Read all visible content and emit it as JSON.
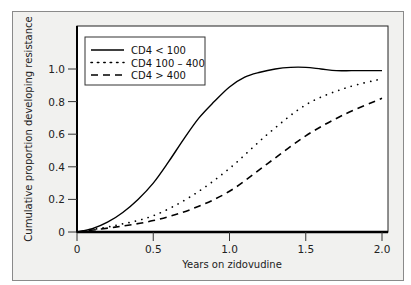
{
  "chart_data": {
    "type": "line",
    "title": "",
    "xlabel": "Years on zidovudine",
    "ylabel": "Cumulative proportion developing resistance",
    "xlim": [
      0,
      2.0
    ],
    "ylim": [
      0,
      1.15
    ],
    "xticks": [
      "0",
      "0.5",
      "1.0",
      "1.5",
      "2.0"
    ],
    "yticks": [
      "0",
      "0.2",
      "0.4",
      "0.6",
      "0.8",
      "1.0"
    ],
    "grid": false,
    "legend_position": "upper left",
    "series": [
      {
        "name": "CD4 < 100",
        "style": "solid",
        "x": [
          0,
          0.1,
          0.2,
          0.3,
          0.4,
          0.5,
          0.6,
          0.7,
          0.8,
          0.9,
          1.0,
          1.1,
          1.2,
          1.3,
          1.4,
          1.5,
          1.6,
          1.7,
          1.8,
          1.9,
          2.0
        ],
        "values": [
          0,
          0.02,
          0.06,
          0.12,
          0.2,
          0.3,
          0.43,
          0.57,
          0.7,
          0.8,
          0.89,
          0.95,
          0.98,
          1.0,
          1.01,
          1.01,
          1.0,
          0.99,
          0.99,
          0.99,
          0.99
        ]
      },
      {
        "name": "CD4 100 – 400",
        "style": "dotted",
        "x": [
          0,
          0.25,
          0.5,
          0.75,
          1.0,
          1.25,
          1.5,
          1.75,
          2.0
        ],
        "values": [
          0,
          0.04,
          0.1,
          0.22,
          0.39,
          0.6,
          0.78,
          0.88,
          0.94
        ]
      },
      {
        "name": "CD4 > 400",
        "style": "dashed",
        "x": [
          0,
          0.25,
          0.5,
          0.75,
          1.0,
          1.25,
          1.5,
          1.75,
          2.0
        ],
        "values": [
          0,
          0.03,
          0.07,
          0.14,
          0.25,
          0.42,
          0.59,
          0.72,
          0.82
        ]
      }
    ]
  },
  "legend": {
    "items": [
      {
        "label": "CD4 < 100"
      },
      {
        "label": "CD4 100 – 400"
      },
      {
        "label": "CD4 > 400"
      }
    ]
  },
  "axes": {
    "xlabel": "Years on zidovudine",
    "ylabel": "Cumulative proportion developing resistance",
    "xticks": [
      "0",
      "0.5",
      "1.0",
      "1.5",
      "2.0"
    ],
    "yticks": [
      "0",
      "0.2",
      "0.4",
      "0.6",
      "0.8",
      "1.0"
    ]
  }
}
